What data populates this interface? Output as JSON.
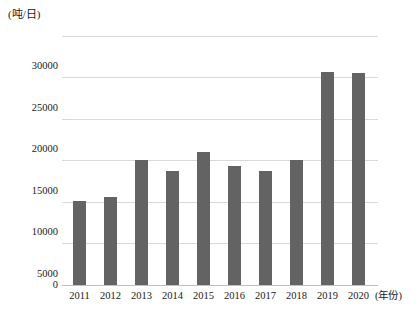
{
  "chart_data": {
    "type": "bar",
    "title": "",
    "subtitle": "",
    "xlabel": "(年份)",
    "ylabel": "(吨/日)",
    "categories": [
      "2011",
      "2012",
      "2013",
      "2014",
      "2015",
      "2016",
      "2017",
      "2018",
      "2019",
      "2020"
    ],
    "values": [
      10000,
      10500,
      15000,
      13700,
      15900,
      14200,
      13700,
      15000,
      25600,
      25400
    ],
    "series": [
      {
        "name": "日处理量",
        "values": [
          10000,
          10500,
          15000,
          13700,
          15900,
          14200,
          13700,
          15000,
          25600,
          25400
        ]
      }
    ],
    "ylim": [
      0,
      30000
    ],
    "ytick_values": [
      0,
      5000,
      10000,
      15000,
      20000,
      25000,
      30000
    ],
    "ytick_labels": [
      "0",
      "5000",
      "10000",
      "15000",
      "20000",
      "25000",
      "30000"
    ],
    "grid": true,
    "legend": false,
    "legend_position": "none",
    "bar_color": "#636363",
    "gridline_color": "#d9d9d9",
    "axis_color": "#bfbfbf",
    "background_color": "#ffffff"
  }
}
